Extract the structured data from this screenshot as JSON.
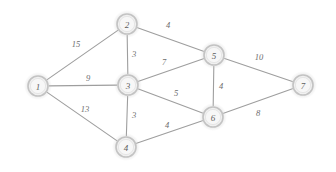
{
  "diagram": {
    "type": "weighted-undirected-graph",
    "title": "",
    "background_color": "#ffffff",
    "node_fill_color": "#f0f0f0",
    "node_ring_color": "#c3c3c3",
    "edge_color": "#9e9e9e",
    "label_color": "#5e5e5e",
    "weight_color": "#6d6d6d"
  },
  "nodes": [
    {
      "id": "1",
      "label": "1",
      "cx": 38,
      "cy": 86,
      "r": 10
    },
    {
      "id": "2",
      "label": "2",
      "cx": 127,
      "cy": 24,
      "r": 10
    },
    {
      "id": "3",
      "label": "3",
      "cx": 128,
      "cy": 85,
      "r": 10
    },
    {
      "id": "4",
      "label": "4",
      "cx": 126,
      "cy": 147,
      "r": 10
    },
    {
      "id": "5",
      "label": "5",
      "cx": 214,
      "cy": 55,
      "r": 10
    },
    {
      "id": "6",
      "label": "6",
      "cx": 213,
      "cy": 117,
      "r": 10
    },
    {
      "id": "7",
      "label": "7",
      "cx": 303,
      "cy": 85,
      "r": 10
    }
  ],
  "edges": [
    {
      "id": "e-1-2",
      "source": "1",
      "target": "2",
      "weight": "15",
      "lx": 76,
      "ly": 45
    },
    {
      "id": "e-1-3",
      "source": "1",
      "target": "3",
      "weight": "9",
      "lx": 88,
      "ly": 79
    },
    {
      "id": "e-1-4",
      "source": "1",
      "target": "4",
      "weight": "13",
      "lx": 85,
      "ly": 110
    },
    {
      "id": "e-2-3",
      "source": "2",
      "target": "3",
      "weight": "3",
      "lx": 134,
      "ly": 55
    },
    {
      "id": "e-2-5",
      "source": "2",
      "target": "5",
      "weight": "4",
      "lx": 168,
      "ly": 26
    },
    {
      "id": "e-3-5",
      "source": "3",
      "target": "5",
      "weight": "7",
      "lx": 164,
      "ly": 63
    },
    {
      "id": "e-3-4",
      "source": "3",
      "target": "4",
      "weight": "3",
      "lx": 134,
      "ly": 116
    },
    {
      "id": "e-3-6",
      "source": "3",
      "target": "6",
      "weight": "5",
      "lx": 176,
      "ly": 94
    },
    {
      "id": "e-4-6",
      "source": "4",
      "target": "6",
      "weight": "4",
      "lx": 167,
      "ly": 126
    },
    {
      "id": "e-5-6",
      "source": "5",
      "target": "6",
      "weight": "4",
      "lx": 221,
      "ly": 87
    },
    {
      "id": "e-5-7",
      "source": "5",
      "target": "7",
      "weight": "10",
      "lx": 259,
      "ly": 58
    },
    {
      "id": "e-6-7",
      "source": "6",
      "target": "7",
      "weight": "8",
      "lx": 258,
      "ly": 114
    }
  ]
}
